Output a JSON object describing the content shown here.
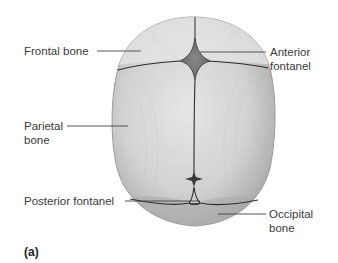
{
  "figure": {
    "panel_label": "(a)",
    "labels": {
      "frontal_bone": "Frontal bone",
      "anterior_fontanel_line1": "Anterior",
      "anterior_fontanel_line2": "fontanel",
      "parietal_bone_line1": "Parietal",
      "parietal_bone_line2": "bone",
      "posterior_fontanel": "Posterior fontanel",
      "occipital_bone_line1": "Occipital",
      "occipital_bone_line2": "bone"
    },
    "colors": {
      "bone_light": "#e2e2e2",
      "bone_mid": "#c4c4c4",
      "bone_dark": "#8e8e8e",
      "suture": "#2e2e2e",
      "fontanel": "#7a7a7a",
      "leader_line": "#444444",
      "text": "#3a3a3a"
    }
  }
}
